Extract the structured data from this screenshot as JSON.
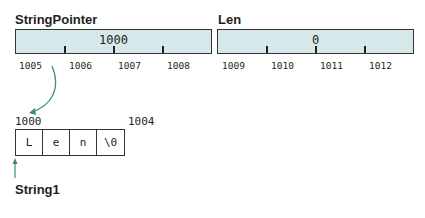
{
  "variables": [
    {
      "name": "StringPointer",
      "value": "1000",
      "addresses": [
        "1005",
        "1006",
        "1007",
        "1008"
      ]
    },
    {
      "name": "Len",
      "value": "0",
      "addresses": [
        "1009",
        "1010",
        "1011",
        "1012"
      ]
    }
  ],
  "string": {
    "name": "String1",
    "start_address": "1000",
    "end_address": "1004",
    "cells": [
      "L",
      "e",
      "n",
      "\\0"
    ]
  },
  "colors": {
    "cell_fill": "#d7e8ea",
    "arrow": "#3d8a82"
  }
}
